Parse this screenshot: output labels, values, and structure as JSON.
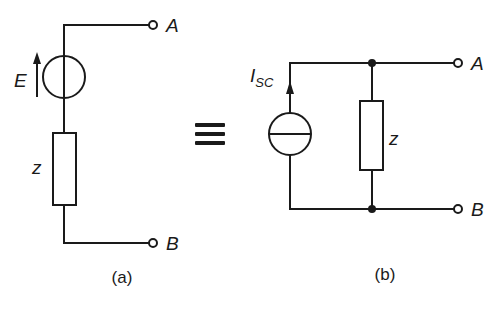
{
  "diagram": {
    "colors": {
      "stroke": "#1a1a1a",
      "background": "#ffffff"
    },
    "equivalence_symbol": "≡",
    "circuit_a": {
      "caption": "(a)",
      "source_label": "E",
      "source_type": "voltage-source",
      "impedance_label": "z",
      "terminal_top": "A",
      "terminal_bottom": "B"
    },
    "circuit_b": {
      "caption": "(b)",
      "source_label_main": "I",
      "source_label_sub": "SC",
      "source_type": "current-source",
      "impedance_label": "z",
      "terminal_top": "A",
      "terminal_bottom": "B"
    }
  }
}
